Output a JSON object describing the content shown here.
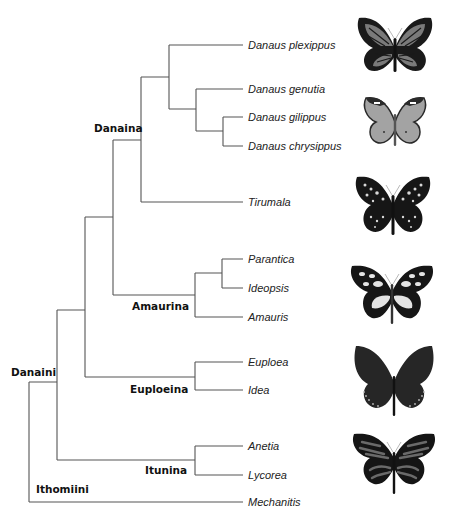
{
  "figure": {
    "type": "phylogenetic-tree",
    "line_color": "#555555",
    "leaves": [
      {
        "name": "Danaus plexippus",
        "y": 45
      },
      {
        "name": "Danaus genutia",
        "y": 89
      },
      {
        "name": "Danaus gilippus",
        "y": 117
      },
      {
        "name": "Danaus chrysippus",
        "y": 146
      },
      {
        "name": "Tirumala",
        "y": 202
      },
      {
        "name": "Parantica",
        "y": 259
      },
      {
        "name": "Ideopsis",
        "y": 288
      },
      {
        "name": "Amauris",
        "y": 317
      },
      {
        "name": "Euploea",
        "y": 362
      },
      {
        "name": "Idea",
        "y": 390
      },
      {
        "name": "Anetia",
        "y": 446
      },
      {
        "name": "Lycorea",
        "y": 475
      },
      {
        "name": "Mechanitis",
        "y": 502
      }
    ],
    "clades": [
      {
        "name": "Danaina",
        "x": 86,
        "y": 122
      },
      {
        "name": "Amaurina",
        "x": 132,
        "y": 300
      },
      {
        "name": "Euploeina",
        "x": 130,
        "y": 383
      },
      {
        "name": "Itunina",
        "x": 144,
        "y": 464
      },
      {
        "name": "Danaini",
        "x": 11,
        "y": 366
      },
      {
        "name": "Ithomiini",
        "x": 36,
        "y": 485
      }
    ],
    "butterflies": [
      {
        "name": "monarch-butterfly-image",
        "represents": "Danaus plexippus",
        "x": 355,
        "y": 14,
        "fill": "#7a7a7a",
        "dark": "#1a1a1a",
        "pattern": "veins"
      },
      {
        "name": "queen-butterfly-image",
        "represents": "Danaus gilippus / chrysippus",
        "x": 360,
        "y": 92,
        "fill": "#a3a3a3",
        "dark": "#2a2a2a",
        "pattern": "plain"
      },
      {
        "name": "tirumala-butterfly-image",
        "represents": "Tirumala",
        "x": 353,
        "y": 173,
        "fill": "#1a1a1a",
        "dark": "#111111",
        "pattern": "spots"
      },
      {
        "name": "amauris-butterfly-image",
        "represents": "Amaurina",
        "x": 348,
        "y": 262,
        "fill": "#1a1a1a",
        "dark": "#111111",
        "pattern": "patches"
      },
      {
        "name": "euploea-butterfly-image",
        "represents": "Euploeina",
        "x": 352,
        "y": 346,
        "fill": "#2b2b2b",
        "dark": "#151515",
        "pattern": "dark"
      },
      {
        "name": "lycorea-butterfly-image",
        "represents": "Itunina",
        "x": 350,
        "y": 430,
        "fill": "#6a6a6a",
        "dark": "#151515",
        "pattern": "stripes"
      }
    ]
  }
}
